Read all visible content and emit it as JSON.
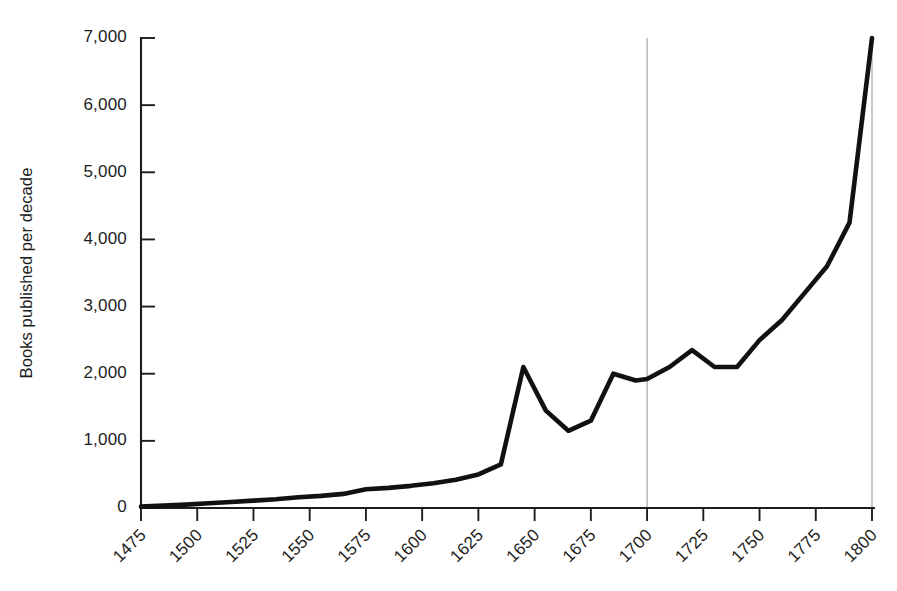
{
  "chart_data": {
    "type": "line",
    "title": "",
    "xlabel": "",
    "ylabel": "Books published per decade",
    "xlim": [
      1475,
      1800
    ],
    "ylim": [
      0,
      7000
    ],
    "grid": "vertical-only",
    "gridlines_x": [
      1700,
      1800
    ],
    "legend": "none",
    "x_tick_labels": [
      "1475",
      "1500",
      "1525",
      "1550",
      "1575",
      "1600",
      "1625",
      "1650",
      "1675",
      "1700",
      "1725",
      "1750",
      "1775",
      "1800"
    ],
    "x_ticks": [
      1475,
      1500,
      1525,
      1550,
      1575,
      1600,
      1625,
      1650,
      1675,
      1700,
      1725,
      1750,
      1775,
      1800
    ],
    "y_tick_labels": [
      "0",
      "1,000",
      "2,000",
      "3,000",
      "4,000",
      "5,000",
      "6,000",
      "7,000"
    ],
    "y_ticks": [
      0,
      1000,
      2000,
      3000,
      4000,
      5000,
      6000,
      7000
    ],
    "series": [
      {
        "name": "Books published per decade",
        "color": "#111111",
        "x": [
          1475,
          1485,
          1495,
          1505,
          1515,
          1525,
          1535,
          1545,
          1555,
          1565,
          1575,
          1585,
          1595,
          1605,
          1615,
          1625,
          1635,
          1645,
          1655,
          1665,
          1675,
          1685,
          1695,
          1700,
          1710,
          1720,
          1730,
          1740,
          1750,
          1760,
          1770,
          1780,
          1790,
          1800
        ],
        "values": [
          20,
          35,
          50,
          70,
          90,
          110,
          130,
          160,
          180,
          210,
          280,
          300,
          330,
          370,
          420,
          500,
          650,
          2100,
          1450,
          1150,
          1300,
          2000,
          1900,
          1920,
          2100,
          2350,
          2100,
          2100,
          2500,
          2800,
          3200,
          3600,
          4250,
          7000
        ]
      }
    ]
  },
  "axis": {
    "y_label_text": "Books published per decade"
  }
}
